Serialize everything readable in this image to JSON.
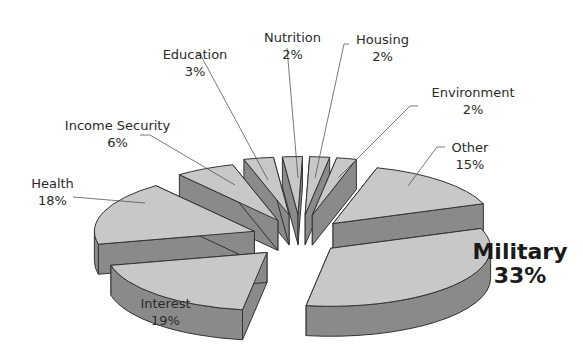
{
  "chart_data": {
    "type": "pie",
    "style": "3d-exploded",
    "title": "",
    "categories": [
      "Military",
      "Interest",
      "Health",
      "Income Security",
      "Education",
      "Nutrition",
      "Housing",
      "Environment",
      "Other"
    ],
    "values": [
      33,
      19,
      18,
      6,
      3,
      2,
      2,
      2,
      15
    ],
    "unit": "%",
    "labels": [
      {
        "name": "Military",
        "value": "33%"
      },
      {
        "name": "Interest",
        "value": "19%"
      },
      {
        "name": "Health",
        "value": "18%"
      },
      {
        "name": "Income Security",
        "value": "6%"
      },
      {
        "name": "Education",
        "value": "3%"
      },
      {
        "name": "Nutrition",
        "value": "2%"
      },
      {
        "name": "Housing",
        "value": "2%"
      },
      {
        "name": "Environment",
        "value": "2%"
      },
      {
        "name": "Other",
        "value": "15%"
      }
    ],
    "colors": {
      "top": "#c8c8c8",
      "side": "#8a8a8a",
      "edge": "#333333"
    },
    "legend": "none (callout labels)"
  }
}
